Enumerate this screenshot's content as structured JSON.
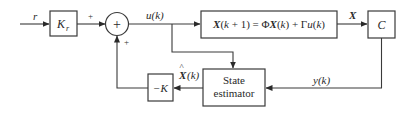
{
  "diagram": {
    "type": "block-diagram",
    "title": "",
    "signals": {
      "reference": "r",
      "control": "u(k)",
      "state": "X",
      "output": "y(k)",
      "estimate_symbol": "X",
      "estimate_arg": "(k)"
    },
    "blocks": {
      "gain_kr": {
        "main": "K",
        "sub": "r"
      },
      "plant": {
        "label": "X(k + 1) = ΦX(k) + Γu(k)"
      },
      "output_matrix": {
        "label": "C"
      },
      "feedback_gain": {
        "label": "−K"
      },
      "estimator": {
        "line1": "State",
        "line2": "estimator"
      }
    },
    "summing_junction": {
      "symbol": "+",
      "input_signs": [
        "+",
        "+"
      ]
    },
    "connections": [
      {
        "from": "r",
        "to": "gain_kr"
      },
      {
        "from": "gain_kr",
        "to": "summing_junction",
        "sign": "+"
      },
      {
        "from": "summing_junction",
        "to": "plant",
        "signal": "u(k)"
      },
      {
        "from": "u(k)",
        "to": "estimator"
      },
      {
        "from": "plant",
        "to": "output_matrix",
        "signal": "X"
      },
      {
        "from": "output_matrix",
        "to": "estimator",
        "signal": "y(k)"
      },
      {
        "from": "estimator",
        "to": "feedback_gain",
        "signal": "X̂(k)"
      },
      {
        "from": "feedback_gain",
        "to": "summing_junction",
        "sign": "+"
      }
    ]
  }
}
